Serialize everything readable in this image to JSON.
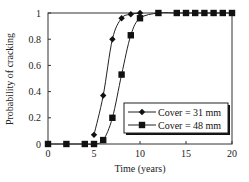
{
  "chart_data": {
    "type": "line",
    "title": "",
    "xlabel": "Time (years)",
    "ylabel": "Probability of cracking",
    "xlim": [
      0,
      20
    ],
    "ylim": [
      0,
      1
    ],
    "xticks": [
      0,
      5,
      10,
      15,
      20
    ],
    "yticks": [
      0,
      0.2,
      0.4,
      0.6,
      0.8,
      1
    ],
    "xtick_labels": [
      "0",
      "5",
      "10",
      "15",
      "20"
    ],
    "ytick_labels": [
      "0",
      "0.2",
      "0.4",
      "0.6",
      "0.8",
      "1"
    ],
    "grid": false,
    "legend_position": "lower right",
    "series": [
      {
        "name": "Cover = 31 mm",
        "marker": "diamond",
        "x": [
          5,
          6,
          7,
          8,
          9,
          10
        ],
        "values": [
          0.07,
          0.37,
          0.8,
          0.96,
          0.99,
          1.0
        ]
      },
      {
        "name": "Cover = 48 mm",
        "marker": "square",
        "x": [
          0,
          2,
          4,
          5,
          6,
          7,
          8,
          9,
          10,
          12,
          14,
          15,
          16,
          17,
          18,
          19,
          20
        ],
        "values": [
          0,
          0,
          0,
          0,
          0.03,
          0.2,
          0.53,
          0.83,
          0.96,
          1.0,
          1.0,
          1.0,
          1.0,
          1.0,
          1.0,
          1.0,
          1.0
        ]
      }
    ]
  },
  "legend": {
    "items": [
      {
        "label": "Cover = 31 mm"
      },
      {
        "label": "Cover = 48 mm"
      }
    ]
  },
  "axes": {
    "xlabel": "Time (years)",
    "ylabel": "Probability of cracking"
  },
  "colors": {
    "line": "#222222",
    "marker": "#111111",
    "axis": "#333333"
  }
}
